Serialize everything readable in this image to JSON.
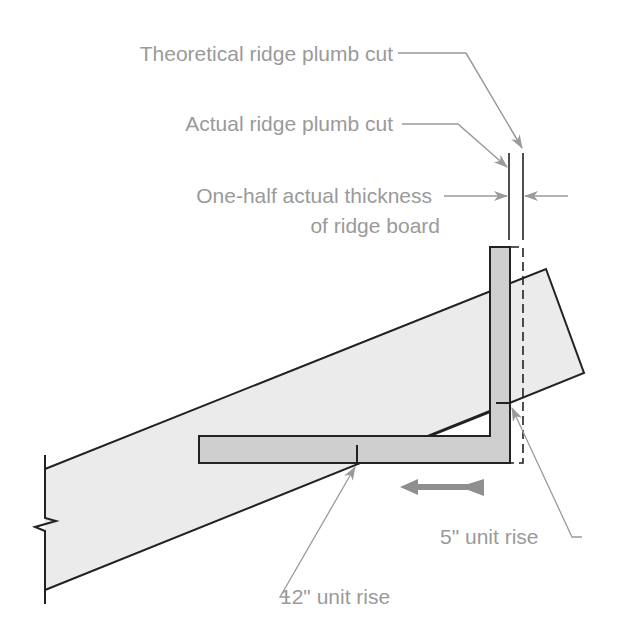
{
  "labels": {
    "theoretical_cut": "Theoretical ridge plumb cut",
    "actual_cut": "Actual ridge plumb cut",
    "half_thickness_line1": "One-half actual thickness",
    "half_thickness_line2": "of ridge board",
    "five_inch_rise": "5\" unit rise",
    "twelve_inch_rise": "12\" unit rise"
  },
  "colors": {
    "rafter_fill": "#ebebeb",
    "square_fill": "#cfcfcf",
    "outline": "#222222",
    "leader": "#9a9a9a",
    "label_text": "#9a9a9a"
  },
  "elements": {
    "rafter": "rafter-board",
    "framing_square": "framing-square",
    "direction_arrow": "slide-direction-arrow"
  }
}
